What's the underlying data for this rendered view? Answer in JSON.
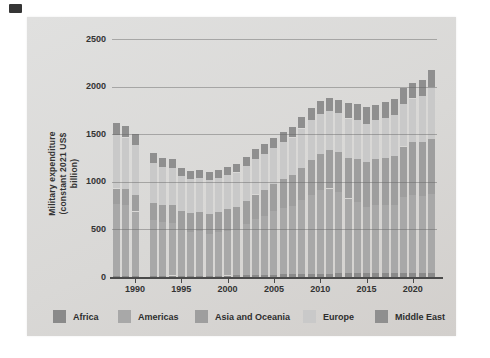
{
  "panel": {
    "background": "#d8d7d5"
  },
  "corner_mark": {
    "color": "#353535"
  },
  "chart_data": {
    "type": "bar",
    "stacked": true,
    "title": "",
    "xlabel": "",
    "ylabel": "Military expenditure (constant 2021 US$ billion)",
    "ylabel_line1": "Military expenditure",
    "ylabel_line2": "(constant 2021 US$ billion)",
    "ylim": [
      0,
      2500
    ],
    "yticks": [
      0,
      500,
      1000,
      1500,
      2000,
      2500
    ],
    "xticks": [
      1990,
      1995,
      2000,
      2005,
      2010,
      2015,
      2020
    ],
    "grid": true,
    "legend_position": "bottom",
    "gap_years": [
      1991
    ],
    "x": [
      1988,
      1989,
      1990,
      1991,
      1992,
      1993,
      1994,
      1995,
      1996,
      1997,
      1998,
      1999,
      2000,
      2001,
      2002,
      2003,
      2004,
      2005,
      2006,
      2007,
      2008,
      2009,
      2010,
      2011,
      2012,
      2013,
      2014,
      2015,
      2016,
      2017,
      2018,
      2019,
      2020,
      2021,
      2022
    ],
    "series": [
      {
        "name": "Africa",
        "color": "#8a8a8a",
        "values": [
          15,
          15,
          15,
          null,
          15,
          15,
          15,
          15,
          15,
          15,
          15,
          15,
          16,
          17,
          18,
          20,
          22,
          25,
          27,
          28,
          30,
          32,
          35,
          37,
          38,
          40,
          44,
          42,
          40,
          39,
          38,
          38,
          39,
          39,
          40
        ]
      },
      {
        "name": "Americas",
        "color": "#a8a8a8",
        "values": [
          750,
          737,
          673,
          null,
          585,
          560,
          555,
          485,
          455,
          465,
          440,
          455,
          469,
          486,
          537,
          592,
          623,
          665,
          698,
          722,
          780,
          828,
          875,
          893,
          857,
          785,
          741,
          698,
          715,
          716,
          722,
          802,
          826,
          816,
          830
        ]
      },
      {
        "name": "Asia and Oceania",
        "color": "#9e9e9e",
        "values": [
          165,
          168,
          172,
          null,
          180,
          185,
          190,
          195,
          200,
          205,
          210,
          215,
          225,
          235,
          245,
          255,
          270,
          285,
          300,
          320,
          340,
          370,
          385,
          400,
          415,
          430,
          450,
          465,
          480,
          495,
          510,
          530,
          550,
          565,
          580
        ]
      },
      {
        "name": "Europe",
        "color": "#c9c9c9",
        "values": [
          560,
          545,
          525,
          null,
          420,
          400,
          390,
          365,
          355,
          355,
          350,
          355,
          360,
          360,
          370,
          375,
          380,
          385,
          390,
          395,
          410,
          420,
          420,
          415,
          410,
          410,
          415,
          400,
          410,
          420,
          430,
          450,
          460,
          480,
          545
        ]
      },
      {
        "name": "Middle East",
        "color": "#8f8f8f",
        "values": [
          130,
          125,
          115,
          null,
          100,
          95,
          90,
          85,
          85,
          85,
          85,
          85,
          90,
          92,
          95,
          98,
          100,
          105,
          110,
          115,
          120,
          125,
          130,
          135,
          145,
          160,
          165,
          180,
          165,
          170,
          170,
          165,
          160,
          175,
          185
        ]
      }
    ],
    "totals_note": "world totals rise from ~1620 (1988) dip to ~1100 (late 1990s) and climb to ~2180 (2022)"
  }
}
